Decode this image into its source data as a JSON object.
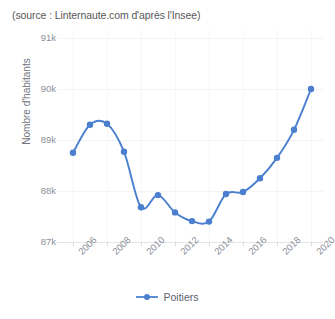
{
  "source_note": "(source : Linternaute.com d'après l'Insee)",
  "legend": {
    "label": "Poitiers",
    "color": "#4a7fd0"
  },
  "axes": {
    "ylabel": "Nombre d'habitants",
    "yticks": [
      "87k",
      "88k",
      "89k",
      "90k",
      "91k"
    ],
    "xticks": [
      "2006",
      "2008",
      "2010",
      "2012",
      "2014",
      "2016",
      "2018",
      "2020"
    ]
  },
  "chart_data": {
    "type": "line",
    "title": "",
    "subtitle": "(source : Linternaute.com d'après l'Insee)",
    "xlabel": "",
    "ylabel": "Nombre d'habitants",
    "x": [
      2006,
      2007,
      2008,
      2009,
      2010,
      2011,
      2012,
      2013,
      2014,
      2015,
      2016,
      2017,
      2018,
      2019,
      2020
    ],
    "xtick_labels": [
      "2006",
      "2008",
      "2010",
      "2012",
      "2014",
      "2016",
      "2018",
      "2020"
    ],
    "ytick_labels": [
      "87k",
      "88k",
      "89k",
      "90k",
      "91k"
    ],
    "ylim": [
      87000,
      91000
    ],
    "xlim": [
      2006,
      2020
    ],
    "grid": true,
    "legend_position": "bottom",
    "marker": "circle",
    "series": [
      {
        "name": "Poitiers",
        "color": "#4a7fd0",
        "values": [
          88750,
          89300,
          89320,
          88770,
          87680,
          87920,
          87580,
          87410,
          87400,
          87940,
          87980,
          88250,
          88650,
          89200,
          90000
        ]
      }
    ]
  }
}
